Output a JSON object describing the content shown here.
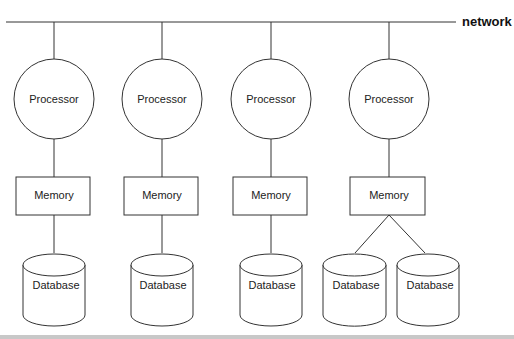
{
  "diagram": {
    "network_label": "network",
    "nodes": [
      {
        "processor": "Processor",
        "memory": "Memory",
        "databases": [
          "Database"
        ]
      },
      {
        "processor": "Processor",
        "memory": "Memory",
        "databases": [
          "Database"
        ]
      },
      {
        "processor": "Processor",
        "memory": "Memory",
        "databases": [
          "Database"
        ]
      },
      {
        "processor": "Processor",
        "memory": "Memory",
        "databases": [
          "Database",
          "Database"
        ]
      }
    ]
  },
  "colors": {
    "stroke": "#333333",
    "background": "#ffffff"
  }
}
